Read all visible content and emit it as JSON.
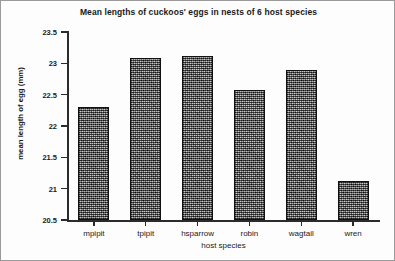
{
  "chart_data": {
    "type": "bar",
    "title": "Mean lengths of cuckoos' eggs in nests of 6 host species",
    "xlabel": "host species",
    "ylabel": "mean length of egg (mm)",
    "categories": [
      "mpipit",
      "tpipit",
      "hsparrow",
      "robin",
      "wagtail",
      "wren"
    ],
    "values": [
      22.3,
      23.08,
      23.12,
      22.57,
      22.9,
      21.12
    ],
    "ylim": [
      20.5,
      23.5
    ],
    "ytick_labels": [
      "23.5",
      "23",
      "22.5",
      "22",
      "21.5",
      "21",
      "20.5"
    ],
    "ytick_values": [
      23.5,
      23,
      22.5,
      22,
      21.5,
      21,
      20.5
    ],
    "grid": false,
    "legend": false,
    "bar_fill_color": "#6b6b6b",
    "bar_edge_color": "#111111",
    "background_color": "#ffffff",
    "axis_color": "#2b2b2b"
  }
}
